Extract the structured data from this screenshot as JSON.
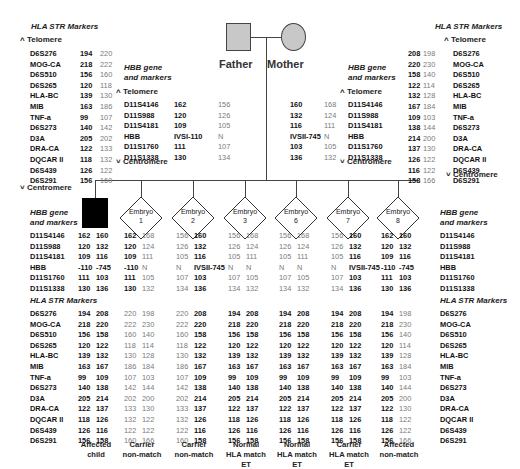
{
  "parents": {
    "father": {
      "label": "Father",
      "fill": "#c8c8c8"
    },
    "mother": {
      "label": "Mother",
      "fill": "#c8c8c8"
    }
  },
  "labels": {
    "hla_title": "HLA STR Markers",
    "hbb_title_1": "HBB gene",
    "hbb_title_2": "and markers",
    "telomere": "Telomere",
    "centromere": "Centromere",
    "telomere_icon": "^",
    "centromere_icon": "v"
  },
  "hla_markers": [
    "D6S276",
    "MOG-CA",
    "D6S510",
    "D6S265",
    "HLA-BC",
    "MIB",
    "TNF-a",
    "D6S273",
    "D3A",
    "DRA-CA",
    "DQCAR II",
    "D6S439",
    "D6S291"
  ],
  "hbb_markers": [
    "D11S4146",
    "D11S988",
    "D11S4181",
    "HBB",
    "D11S1760",
    "D11S1338"
  ],
  "father": {
    "hla": [
      [
        "194",
        "220"
      ],
      [
        "218",
        "222"
      ],
      [
        "156",
        "160"
      ],
      [
        "120",
        "118"
      ],
      [
        "139",
        "130"
      ],
      [
        "163",
        "186"
      ],
      [
        "99",
        "107"
      ],
      [
        "140",
        "142"
      ],
      [
        "205",
        "202"
      ],
      [
        "122",
        "133"
      ],
      [
        "118",
        "132"
      ],
      [
        "126",
        "122"
      ],
      [
        "156",
        "160"
      ]
    ],
    "hbb": [
      [
        "162",
        "156"
      ],
      [
        "120",
        "126"
      ],
      [
        "109",
        "105"
      ],
      [
        "IVSI-110",
        "N"
      ],
      [
        "111",
        "107"
      ],
      [
        "130",
        "134"
      ]
    ]
  },
  "mother": {
    "hla": [
      [
        "208",
        "198"
      ],
      [
        "220",
        "230"
      ],
      [
        "158",
        "140"
      ],
      [
        "122",
        "114"
      ],
      [
        "132",
        "128"
      ],
      [
        "167",
        "184"
      ],
      [
        "109",
        "103"
      ],
      [
        "138",
        "144"
      ],
      [
        "214",
        "200"
      ],
      [
        "137",
        "130"
      ],
      [
        "126",
        "122"
      ],
      [
        "116",
        "122"
      ],
      [
        "158",
        "166"
      ]
    ],
    "hbb": [
      [
        "160",
        "168"
      ],
      [
        "132",
        "124"
      ],
      [
        "116",
        "111"
      ],
      [
        "IVSII-745",
        "N"
      ],
      [
        "103",
        "105"
      ],
      [
        "136",
        "132"
      ]
    ]
  },
  "children": [
    {
      "id": "affected-child",
      "label": "",
      "shape": "square-filled",
      "hbb": [
        [
          "162",
          "160"
        ],
        [
          "120",
          "132"
        ],
        [
          "109",
          "116"
        ],
        [
          "-110",
          "-745"
        ],
        [
          "111",
          "103"
        ],
        [
          "130",
          "136"
        ]
      ],
      "hbb_style": [
        "d",
        "d"
      ],
      "hla": [
        [
          "194",
          "208"
        ],
        [
          "218",
          "220"
        ],
        [
          "156",
          "158"
        ],
        [
          "120",
          "122"
        ],
        [
          "139",
          "132"
        ],
        [
          "163",
          "167"
        ],
        [
          "99",
          "109"
        ],
        [
          "140",
          "138"
        ],
        [
          "205",
          "214"
        ],
        [
          "122",
          "137"
        ],
        [
          "118",
          "126"
        ],
        [
          "126",
          "116"
        ],
        [
          "156",
          "158"
        ]
      ],
      "hla_style": [
        "d",
        "d"
      ],
      "caption": [
        "Affected",
        "child"
      ]
    },
    {
      "id": "embryo-1",
      "label": "Embryo",
      "num": "1",
      "shape": "diamond",
      "hbb": [
        [
          "162",
          "168"
        ],
        [
          "120",
          "124"
        ],
        [
          "109",
          "111"
        ],
        [
          "-110",
          "N"
        ],
        [
          "111",
          "105"
        ],
        [
          "130",
          "132"
        ]
      ],
      "hbb_style": [
        "d",
        "l"
      ],
      "hla": [
        [
          "220",
          "198"
        ],
        [
          "222",
          "230"
        ],
        [
          "160",
          "140"
        ],
        [
          "118",
          "114"
        ],
        [
          "130",
          "128"
        ],
        [
          "186",
          "184"
        ],
        [
          "107",
          "103"
        ],
        [
          "142",
          "144"
        ],
        [
          "202",
          "200"
        ],
        [
          "133",
          "130"
        ],
        [
          "132",
          "122"
        ],
        [
          "122",
          "122"
        ],
        [
          "160",
          "166"
        ]
      ],
      "hla_style": [
        "l",
        "l"
      ],
      "caption": [
        "Carrier",
        "non-match"
      ]
    },
    {
      "id": "embryo-2",
      "label": "Embryo",
      "num": "2",
      "shape": "diamond",
      "hbb": [
        [
          "156",
          "160"
        ],
        [
          "126",
          "132"
        ],
        [
          "105",
          "116"
        ],
        [
          "N",
          "IVSII-745"
        ],
        [
          "107",
          "103"
        ],
        [
          "134",
          "136"
        ]
      ],
      "hbb_style": [
        "l",
        "d"
      ],
      "hla": [
        [
          "220",
          "208"
        ],
        [
          "222",
          "220"
        ],
        [
          "160",
          "158"
        ],
        [
          "118",
          "122"
        ],
        [
          "130",
          "132"
        ],
        [
          "186",
          "167"
        ],
        [
          "107",
          "109"
        ],
        [
          "142",
          "138"
        ],
        [
          "202",
          "214"
        ],
        [
          "133",
          "137"
        ],
        [
          "132",
          "126"
        ],
        [
          "122",
          "116"
        ],
        [
          "160",
          "158"
        ]
      ],
      "hla_style": [
        "l",
        "d"
      ],
      "caption": [
        "Carrier",
        "non-match"
      ]
    },
    {
      "id": "embryo-3",
      "label": "Embryo",
      "num": "3",
      "shape": "diamond",
      "hbb": [
        [
          "156",
          "168"
        ],
        [
          "126",
          "124"
        ],
        [
          "105",
          "111"
        ],
        [
          "N",
          "N"
        ],
        [
          "107",
          "105"
        ],
        [
          "134",
          "132"
        ]
      ],
      "hbb_style": [
        "l",
        "l"
      ],
      "hla": [
        [
          "194",
          "208"
        ],
        [
          "218",
          "220"
        ],
        [
          "156",
          "158"
        ],
        [
          "120",
          "122"
        ],
        [
          "139",
          "132"
        ],
        [
          "163",
          "167"
        ],
        [
          "99",
          "109"
        ],
        [
          "140",
          "138"
        ],
        [
          "205",
          "214"
        ],
        [
          "122",
          "137"
        ],
        [
          "118",
          "126"
        ],
        [
          "126",
          "116"
        ],
        [
          "156",
          "158"
        ]
      ],
      "hla_style": [
        "d",
        "d"
      ],
      "caption": [
        "Normal",
        "HLA match",
        "ET"
      ]
    },
    {
      "id": "embryo-6",
      "label": "Embryo",
      "num": "6",
      "shape": "diamond",
      "hbb": [
        [
          "156",
          "168"
        ],
        [
          "126",
          "124"
        ],
        [
          "105",
          "111"
        ],
        [
          "N",
          "N"
        ],
        [
          "107",
          "105"
        ],
        [
          "134",
          "132"
        ]
      ],
      "hbb_style": [
        "l",
        "l"
      ],
      "hla": [
        [
          "194",
          "208"
        ],
        [
          "218",
          "220"
        ],
        [
          "156",
          "158"
        ],
        [
          "120",
          "122"
        ],
        [
          "139",
          "132"
        ],
        [
          "163",
          "167"
        ],
        [
          "99",
          "109"
        ],
        [
          "140",
          "138"
        ],
        [
          "205",
          "214"
        ],
        [
          "122",
          "137"
        ],
        [
          "118",
          "126"
        ],
        [
          "126",
          "116"
        ],
        [
          "156",
          "158"
        ]
      ],
      "hla_style": [
        "d",
        "d"
      ],
      "caption": [
        "Normal",
        "HLA match",
        "ET"
      ]
    },
    {
      "id": "embryo-7",
      "label": "Embryo",
      "num": "7",
      "shape": "diamond",
      "hbb": [
        [
          "156",
          "160"
        ],
        [
          "126",
          "132"
        ],
        [
          "105",
          "116"
        ],
        [
          "N",
          "IVSII-745"
        ],
        [
          "107",
          "103"
        ],
        [
          "134",
          "136"
        ]
      ],
      "hbb_style": [
        "l",
        "d"
      ],
      "hla": [
        [
          "194",
          "208"
        ],
        [
          "218",
          "220"
        ],
        [
          "156",
          "158"
        ],
        [
          "120",
          "122"
        ],
        [
          "139",
          "132"
        ],
        [
          "163",
          "167"
        ],
        [
          "99",
          "109"
        ],
        [
          "140",
          "138"
        ],
        [
          "205",
          "214"
        ],
        [
          "122",
          "137"
        ],
        [
          "118",
          "126"
        ],
        [
          "126",
          "116"
        ],
        [
          "156",
          "158"
        ]
      ],
      "hla_style": [
        "d",
        "d"
      ],
      "caption": [
        "Carrier",
        "HLA match",
        "ET"
      ]
    },
    {
      "id": "embryo-8",
      "label": "Embryo",
      "num": "8",
      "shape": "diamond",
      "hbb": [
        [
          "162",
          "160"
        ],
        [
          "120",
          "132"
        ],
        [
          "109",
          "116"
        ],
        [
          "-110",
          "-745"
        ],
        [
          "111",
          "103"
        ],
        [
          "130",
          "136"
        ]
      ],
      "hbb_style": [
        "d",
        "d"
      ],
      "hla": [
        [
          "194",
          "198"
        ],
        [
          "218",
          "230"
        ],
        [
          "156",
          "140"
        ],
        [
          "120",
          "114"
        ],
        [
          "139",
          "128"
        ],
        [
          "163",
          "184"
        ],
        [
          "99",
          "103"
        ],
        [
          "140",
          "144"
        ],
        [
          "205",
          "200"
        ],
        [
          "122",
          "130"
        ],
        [
          "118",
          "122"
        ],
        [
          "126",
          "122"
        ],
        [
          "156",
          "166"
        ]
      ],
      "hla_style": [
        "d",
        "l"
      ],
      "caption": [
        "Affected",
        "non-match"
      ]
    }
  ]
}
